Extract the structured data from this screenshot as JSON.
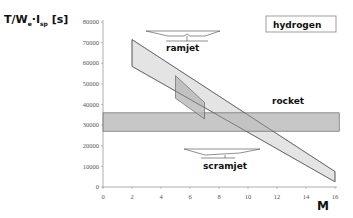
{
  "chart_data": {
    "type": "area",
    "title": "",
    "ylabel": "T/W_e · I_sp [s]",
    "xlabel": "M",
    "xlim": [
      0,
      16
    ],
    "ylim": [
      0,
      80000
    ],
    "x_ticks": [
      "0",
      "2",
      "4",
      "6",
      "8",
      "10",
      "12",
      "14",
      "16"
    ],
    "y_ticks": [
      "0",
      "10000",
      "20000",
      "30000",
      "40000",
      "50000",
      "60000",
      "70000",
      "80000"
    ],
    "grid": false,
    "legend_box": "hydrogen",
    "series": [
      {
        "name": "ramjet",
        "shape": "band",
        "polygon": [
          [
            2,
            71500
          ],
          [
            16,
            7500
          ],
          [
            16,
            2500
          ],
          [
            2,
            58500
          ]
        ],
        "color": "#e4e4e4"
      },
      {
        "name": "scramjet",
        "shape": "band",
        "polygon": [
          [
            5,
            54000
          ],
          [
            7,
            41000
          ],
          [
            7,
            33000
          ],
          [
            5,
            43000
          ]
        ],
        "color": "#b8b8b8"
      },
      {
        "name": "rocket",
        "shape": "band",
        "polygon": [
          [
            0,
            36000
          ],
          [
            16.3,
            36000
          ],
          [
            16.3,
            27000
          ],
          [
            0,
            27000
          ]
        ],
        "color": "#bdbdbd"
      }
    ],
    "annotations": [
      {
        "text": "ramjet",
        "x": 5.3,
        "y": 66000
      },
      {
        "text": "rocket",
        "x": 12,
        "y": 41000
      },
      {
        "text": "scramjet",
        "x": 6.1,
        "y": 14000
      }
    ]
  },
  "labels": {
    "y_axis": "T/W",
    "y_sub_e": "e",
    "y_dot": "·I",
    "y_sub_sp": "sp",
    "y_unit": " [s]",
    "x_axis": "M",
    "legend": "hydrogen",
    "ramjet": "ramjet",
    "rocket": "rocket",
    "scramjet": "scramjet"
  }
}
